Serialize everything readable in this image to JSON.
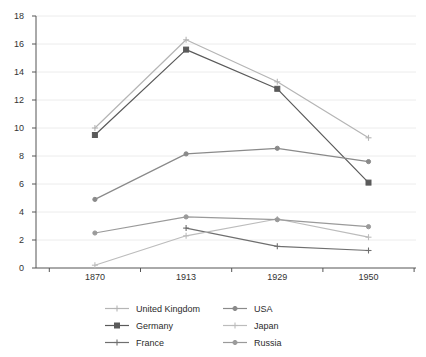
{
  "chart_data": {
    "type": "line",
    "title": "",
    "xlabel": "",
    "ylabel": "",
    "categories": [
      "1870",
      "1913",
      "1929",
      "1950"
    ],
    "x": [
      1870,
      1913,
      1929,
      1950
    ],
    "ylim": [
      0,
      18
    ],
    "yticks": [
      0,
      2,
      4,
      6,
      8,
      10,
      12,
      14,
      16,
      18
    ],
    "ytick_labels": [
      "0",
      "2",
      "4",
      "6",
      "8",
      "10",
      "12",
      "14",
      "16",
      "18"
    ],
    "grid": "horizontal",
    "legend_position": "bottom",
    "series": [
      {
        "name": "United Kingdom",
        "values": [
          10.0,
          16.3,
          13.3,
          9.3
        ],
        "color": "#b5b5b5",
        "marker": "plus"
      },
      {
        "name": "Germany",
        "values": [
          9.5,
          15.6,
          12.8,
          6.1
        ],
        "color": "#5a5a5a",
        "marker": "square"
      },
      {
        "name": "France",
        "values": [
          null,
          2.85,
          1.55,
          1.25
        ],
        "color": "#6f6f6f",
        "marker": "plus"
      },
      {
        "name": "USA",
        "values": [
          4.9,
          8.15,
          8.55,
          7.6
        ],
        "color": "#8a8a8a",
        "marker": "dot"
      },
      {
        "name": "Japan",
        "values": [
          0.2,
          2.3,
          3.5,
          2.2
        ],
        "color": "#bcbcbc",
        "marker": "plus"
      },
      {
        "name": "Russia",
        "values": [
          2.5,
          3.65,
          3.45,
          2.95
        ],
        "color": "#9a9a9a",
        "marker": "dot"
      }
    ]
  },
  "legend": {
    "entries": [
      {
        "label": "United Kingdom",
        "color": "#b5b5b5",
        "marker": "plus"
      },
      {
        "label": "USA",
        "color": "#8a8a8a",
        "marker": "dot"
      },
      {
        "label": "Germany",
        "color": "#5a5a5a",
        "marker": "square"
      },
      {
        "label": "Japan",
        "color": "#bcbcbc",
        "marker": "plus"
      },
      {
        "label": "France",
        "color": "#6f6f6f",
        "marker": "plus"
      },
      {
        "label": "Russia",
        "color": "#9a9a9a",
        "marker": "dot"
      }
    ]
  },
  "axes": {
    "axis_color": "#555555",
    "grid_color": "#ececec"
  }
}
